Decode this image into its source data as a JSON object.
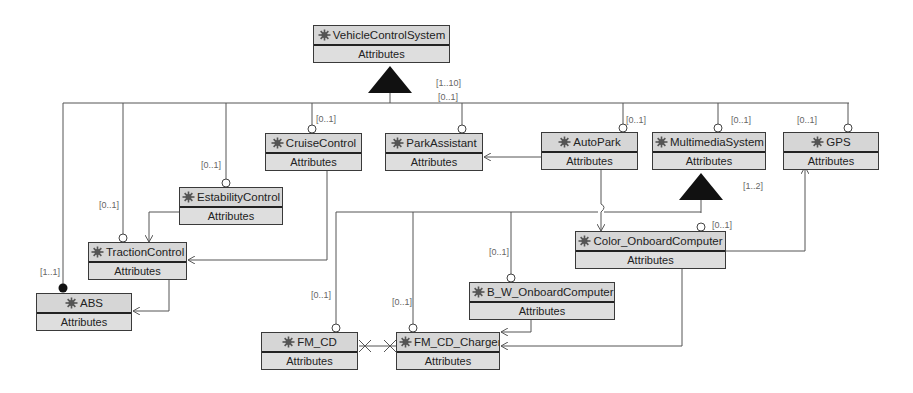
{
  "diagram": {
    "type": "feature-model",
    "colors": {
      "box_fill": "#dcdcdc",
      "line": "#555555",
      "text": "#222222",
      "card_text": "#666666"
    },
    "icon": "gear-puzzle-icon",
    "features": [
      {
        "id": "vcs",
        "name": "VehicleControlSystem",
        "attr": "Attributes",
        "x": 313,
        "y": 25,
        "w": 137
      },
      {
        "id": "cruise",
        "name": "CruiseControl",
        "attr": "Attributes",
        "x": 265,
        "y": 133,
        "w": 97
      },
      {
        "id": "park",
        "name": "ParkAssistant",
        "attr": "Attributes",
        "x": 385,
        "y": 133,
        "w": 98
      },
      {
        "id": "auto",
        "name": "AutoPark",
        "attr": "Attributes",
        "x": 541,
        "y": 132,
        "w": 97
      },
      {
        "id": "mm",
        "name": "MultimediaSystem",
        "attr": "Attributes",
        "x": 652,
        "y": 132,
        "w": 114
      },
      {
        "id": "gps",
        "name": "GPS",
        "attr": "Attributes",
        "x": 783,
        "y": 132,
        "w": 96
      },
      {
        "id": "esta",
        "name": "EstabilityControl",
        "attr": "Attributes",
        "x": 179,
        "y": 187,
        "w": 104
      },
      {
        "id": "trac",
        "name": "TractionControl",
        "attr": "Attributes",
        "x": 88,
        "y": 242,
        "w": 99
      },
      {
        "id": "abs",
        "name": "ABS",
        "attr": "Attributes",
        "x": 36,
        "y": 293,
        "w": 96
      },
      {
        "id": "color",
        "name": "Color_OnboardComputer",
        "attr": "Attributes",
        "x": 575,
        "y": 231,
        "w": 151
      },
      {
        "id": "bw",
        "name": "B_W_OnboardComputer",
        "attr": "Attributes",
        "x": 469,
        "y": 282,
        "w": 146
      },
      {
        "id": "fmcd",
        "name": "FM_CD",
        "attr": "Attributes",
        "x": 261,
        "y": 332,
        "w": 97
      },
      {
        "id": "fmch",
        "name": "FM_CD_Charger",
        "attr": "Attributes",
        "x": 396,
        "y": 332,
        "w": 104
      }
    ],
    "cardinalities": [
      {
        "text": "[1..10]",
        "x": 436,
        "y": 78
      },
      {
        "text": "[0..1]",
        "x": 438,
        "y": 92
      },
      {
        "text": "[0..1]",
        "x": 316,
        "y": 114
      },
      {
        "text": "[0..1]",
        "x": 626,
        "y": 115
      },
      {
        "text": "[0..1]",
        "x": 731,
        "y": 115
      },
      {
        "text": "[0..1]",
        "x": 797,
        "y": 115
      },
      {
        "text": "[0..1]",
        "x": 201,
        "y": 160
      },
      {
        "text": "[0..1]",
        "x": 99,
        "y": 200
      },
      {
        "text": "[1..2]",
        "x": 743,
        "y": 181
      },
      {
        "text": "[0..1]",
        "x": 712,
        "y": 220
      },
      {
        "text": "[0..1]",
        "x": 489,
        "y": 247
      },
      {
        "text": "[1..1]",
        "x": 40,
        "y": 267
      },
      {
        "text": "[0..1]",
        "x": 311,
        "y": 290
      },
      {
        "text": "[0..1]",
        "x": 392,
        "y": 297
      }
    ]
  }
}
